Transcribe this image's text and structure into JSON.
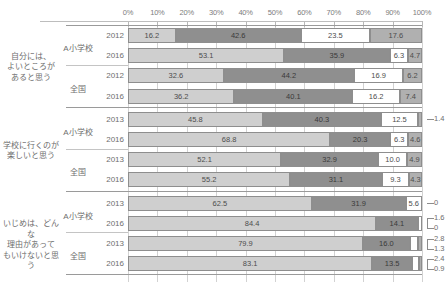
{
  "chart_data": {
    "type": "bar",
    "subtype": "stacked-horizontal-100",
    "title": "",
    "xlabel": "",
    "ylabel": "",
    "xlim": [
      0,
      100
    ],
    "xticks": [
      "0%",
      "10%",
      "20%",
      "30%",
      "40%",
      "50%",
      "60%",
      "70%",
      "80%",
      "90%",
      "100%"
    ],
    "grid": true,
    "legend": "none",
    "series": [
      {
        "name": "seg1",
        "color": "#cfcfcf"
      },
      {
        "name": "seg2",
        "color": "#8f8f8f"
      },
      {
        "name": "seg3",
        "color": "#ffffff"
      },
      {
        "name": "seg4",
        "color": "#b0b0b0"
      }
    ],
    "groups": [
      {
        "question": "自分には、\nよいところが\nあると思う",
        "question_lines": [
          "自分には、",
          "よいところが",
          "あると思う"
        ],
        "subgroups": [
          {
            "name": "A小学校",
            "rows": [
              {
                "year": "2012",
                "values": [
                  16.2,
                  42.6,
                  23.5,
                  17.6
                ],
                "labels": [
                  "16.2",
                  "42.6",
                  "23.5",
                  "17.6"
                ],
                "annotations": []
              },
              {
                "year": "2016",
                "values": [
                  53.1,
                  35.9,
                  6.3,
                  4.7
                ],
                "labels": [
                  "53.1",
                  "35.9",
                  "6.3",
                  "4.7"
                ],
                "annotations": []
              }
            ]
          },
          {
            "name": "全国",
            "rows": [
              {
                "year": "2012",
                "values": [
                  32.6,
                  44.2,
                  16.9,
                  6.2
                ],
                "labels": [
                  "32.6",
                  "44.2",
                  "16.9",
                  "6.2"
                ],
                "annotations": []
              },
              {
                "year": "2016",
                "values": [
                  36.2,
                  40.1,
                  16.2,
                  7.4
                ],
                "labels": [
                  "36.2",
                  "40.1",
                  "16.2",
                  "7.4"
                ],
                "annotations": []
              }
            ]
          }
        ]
      },
      {
        "question": "学校に行くのが\n楽しいと思う",
        "question_lines": [
          "学校に行くのが",
          "楽しいと思う"
        ],
        "subgroups": [
          {
            "name": "A小学校",
            "rows": [
              {
                "year": "2013",
                "values": [
                  45.8,
                  40.3,
                  12.5,
                  1.4
                ],
                "labels": [
                  "45.8",
                  "40.3",
                  "12.5",
                  ""
                ],
                "annotations": [
                  {
                    "text": "1.4",
                    "seg": 3
                  }
                ]
              },
              {
                "year": "2016",
                "values": [
                  68.8,
                  20.3,
                  6.3,
                  4.6
                ],
                "labels": [
                  "68.8",
                  "20.3",
                  "6.3",
                  "4.6"
                ],
                "annotations": []
              }
            ]
          },
          {
            "name": "全国",
            "rows": [
              {
                "year": "2013",
                "values": [
                  52.1,
                  32.9,
                  10.0,
                  4.9
                ],
                "labels": [
                  "52.1",
                  "32.9",
                  "10.0",
                  "4.9"
                ],
                "annotations": []
              },
              {
                "year": "2016",
                "values": [
                  55.2,
                  31.1,
                  9.3,
                  4.3
                ],
                "labels": [
                  "55.2",
                  "31.1",
                  "9.3",
                  "4.3"
                ],
                "annotations": []
              }
            ]
          }
        ]
      },
      {
        "question": "いじめは、どんな\n理由があって\nもいけないと思う",
        "question_lines": [
          "いじめは、どんな",
          "理由があって",
          "もいけないと思う"
        ],
        "subgroups": [
          {
            "name": "A小学校",
            "rows": [
              {
                "year": "2013",
                "values": [
                  62.5,
                  31.9,
                  5.6,
                  0.0
                ],
                "labels": [
                  "62.5",
                  "31.9",
                  "5.6",
                  ""
                ],
                "annotations": [
                  {
                    "text": "0",
                    "seg": 3
                  }
                ]
              },
              {
                "year": "2016",
                "values": [
                  84.4,
                  14.1,
                  1.6,
                  0.0
                ],
                "labels": [
                  "84.4",
                  "14.1",
                  "",
                  ""
                ],
                "annotations": [
                  {
                    "text": "1.6",
                    "seg": 2
                  },
                  {
                    "text": "0",
                    "seg": 3
                  }
                ]
              }
            ]
          },
          {
            "name": "全国",
            "rows": [
              {
                "year": "2013",
                "values": [
                  79.9,
                  16.0,
                  2.8,
                  1.3
                ],
                "labels": [
                  "79.9",
                  "16.0",
                  "",
                  ""
                ],
                "annotations": [
                  {
                    "text": "2.8",
                    "seg": 2
                  },
                  {
                    "text": "1.3",
                    "seg": 3
                  }
                ]
              },
              {
                "year": "2016",
                "values": [
                  83.1,
                  13.5,
                  2.4,
                  0.9
                ],
                "labels": [
                  "83.1",
                  "13.5",
                  "",
                  ""
                ],
                "annotations": [
                  {
                    "text": "2.4",
                    "seg": 2
                  },
                  {
                    "text": "0.9",
                    "seg": 3
                  }
                ]
              }
            ]
          }
        ]
      }
    ]
  }
}
